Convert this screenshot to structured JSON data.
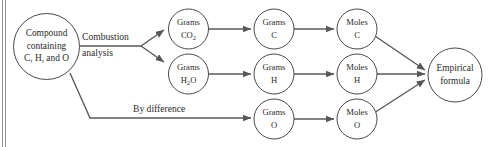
{
  "diagram": {
    "colors": {
      "stroke": "#4a4a4a",
      "arrow": "#58585a",
      "text": "#2b2b2b",
      "frame": "#8e8e92",
      "background": "#ffffff"
    },
    "nodes": {
      "compound": {
        "line1": "Compound",
        "line2": "containing",
        "line3": "C, H, and O"
      },
      "grams_co2": {
        "line1": "Grams",
        "line2": "CO",
        "sub2": "2"
      },
      "grams_h2o": {
        "line1": "Grams",
        "line2": "H",
        "sub2": "2",
        "line2b": "O"
      },
      "grams_c": {
        "line1": "Grams",
        "line2": "C"
      },
      "grams_h": {
        "line1": "Grams",
        "line2": "H"
      },
      "grams_o": {
        "line1": "Grams",
        "line2": "O"
      },
      "moles_c": {
        "line1": "Moles",
        "line2": "C"
      },
      "moles_h": {
        "line1": "Moles",
        "line2": "H"
      },
      "moles_o": {
        "line1": "Moles",
        "line2": "O"
      },
      "empirical": {
        "line1": "Empirical",
        "line2": "formula"
      }
    },
    "edge_labels": {
      "combustion_line1": "Combustion",
      "combustion_line2": "analysis",
      "by_difference": "By difference"
    }
  }
}
